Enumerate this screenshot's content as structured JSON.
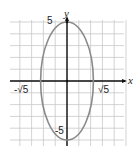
{
  "chart_data": {
    "type": "line",
    "title": "",
    "equation": "x^2/5 + y^2/25 = 1",
    "xlabel": "x",
    "ylabel": "y",
    "xlim": [
      -5,
      5
    ],
    "ylim": [
      -5,
      5
    ],
    "grid": true,
    "grid_step": 1,
    "series": [
      {
        "name": "ellipse",
        "color": "#8a8a8a",
        "center": [
          0,
          0
        ],
        "semi_axis_x": 2.236,
        "semi_axis_y": 5,
        "points": [
          [
            0,
            5
          ],
          [
            2.236,
            0
          ],
          [
            0,
            -5
          ],
          [
            -2.236,
            0
          ]
        ]
      }
    ],
    "annotations": [
      {
        "text": "5",
        "x": 0,
        "y": 5
      },
      {
        "text": "-5",
        "x": 0,
        "y": -5
      },
      {
        "text": "√5",
        "x": 2.236,
        "y": 0
      },
      {
        "text": "-√5",
        "x": -2.236,
        "y": 0
      }
    ]
  },
  "labels": {
    "x_axis": "x",
    "y_axis": "y",
    "top": "5",
    "bottom": "-5",
    "right": "√5",
    "left": "-√5"
  },
  "colors": {
    "grid": "#c8c8c8",
    "axis": "#111111",
    "curve": "#8a8a8a"
  }
}
